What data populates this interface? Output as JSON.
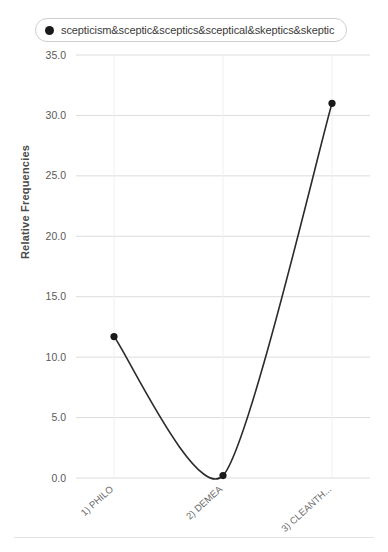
{
  "legend": {
    "entries": [
      {
        "label": "scepticism&sceptic&sceptics&sceptical&skeptics&skeptic",
        "marker": "filled-circle",
        "color": "#1a1a1a"
      }
    ]
  },
  "axes": {
    "y_title": "Relative Frequencies",
    "y_ticks": [
      "0.0",
      "5.0",
      "10.0",
      "15.0",
      "20.0",
      "25.0",
      "30.0",
      "35.0"
    ],
    "x_ticks": [
      "1) PHILO",
      "2) DEMEA",
      "3) CLEANTH..."
    ]
  },
  "chart_data": {
    "type": "line",
    "title": "",
    "xlabel": "",
    "ylabel": "Relative Frequencies",
    "categories": [
      "1) PHILO",
      "2) DEMEA",
      "3) CLEANTH..."
    ],
    "series": [
      {
        "name": "scepticism&sceptic&sceptics&sceptical&skeptics&skeptic",
        "values": [
          11.7,
          0.2,
          31.0
        ],
        "color": "#2b2b2b",
        "marker": "filled-circle",
        "interpolation": "smooth-spline"
      }
    ],
    "ylim": [
      0.0,
      35.0
    ],
    "ytick_step": 5.0,
    "grid": "horizontal",
    "legend_position": "top"
  },
  "style": {
    "line_color": "#2b2b2b",
    "marker_color": "#1a1a1a",
    "grid_color": "#dcdcdc",
    "tick_text_color": "#5a5a5a",
    "axis_title_color": "#4a4a4a",
    "legend_border_color": "#cfcfcf",
    "background": "#ffffff"
  }
}
